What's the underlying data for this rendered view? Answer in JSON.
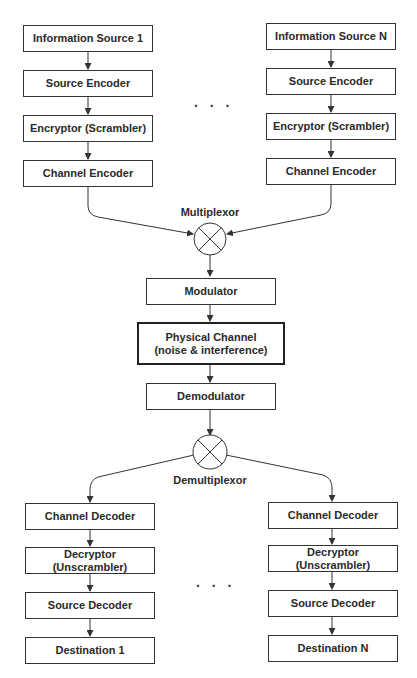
{
  "diagram": {
    "title": "",
    "transmit_left": [
      "Information Source 1",
      "Source Encoder",
      "Encryptor (Scrambler)",
      "Channel Encoder"
    ],
    "transmit_right": [
      "Information Source N",
      "Source Encoder",
      "Encryptor (Scrambler)",
      "Channel Encoder"
    ],
    "ellipsis": ". . .",
    "multiplexor_label": "Multiplexor",
    "center": {
      "modulator": "Modulator",
      "channel_line1": "Physical Channel",
      "channel_line2": "(noise & interference)",
      "demodulator": "Demodulator"
    },
    "demultiplexor_label": "Demultiplexor",
    "receive_left": [
      "Channel Decoder",
      "Decryptor (Unscrambler)",
      "Source Decoder",
      "Destination 1"
    ],
    "receive_right": [
      "Channel Decoder",
      "Decryptor (Unscrambler)",
      "Source Decoder",
      "Destination N"
    ],
    "colors": {
      "stroke": "#333333",
      "text": "#2a2a2a",
      "background": "#ffffff"
    }
  }
}
